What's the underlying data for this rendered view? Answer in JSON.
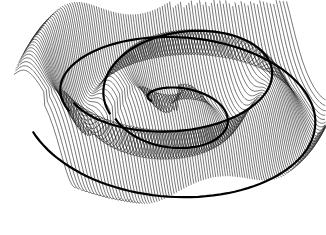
{
  "figure": {
    "type": "3d-wireframe-surface",
    "background": "#ffffff",
    "line_color": "#1a1a1a",
    "ridge_color": "#000000"
  },
  "render": {
    "width": 326,
    "height": 235,
    "center_x": 178,
    "center_y": 98,
    "line_count": 110,
    "segments": 90,
    "scale_x": 150,
    "scale_y": 70,
    "height_scale": 38,
    "ripple_freq": 3.1,
    "spiral_twist": 0.9
  }
}
